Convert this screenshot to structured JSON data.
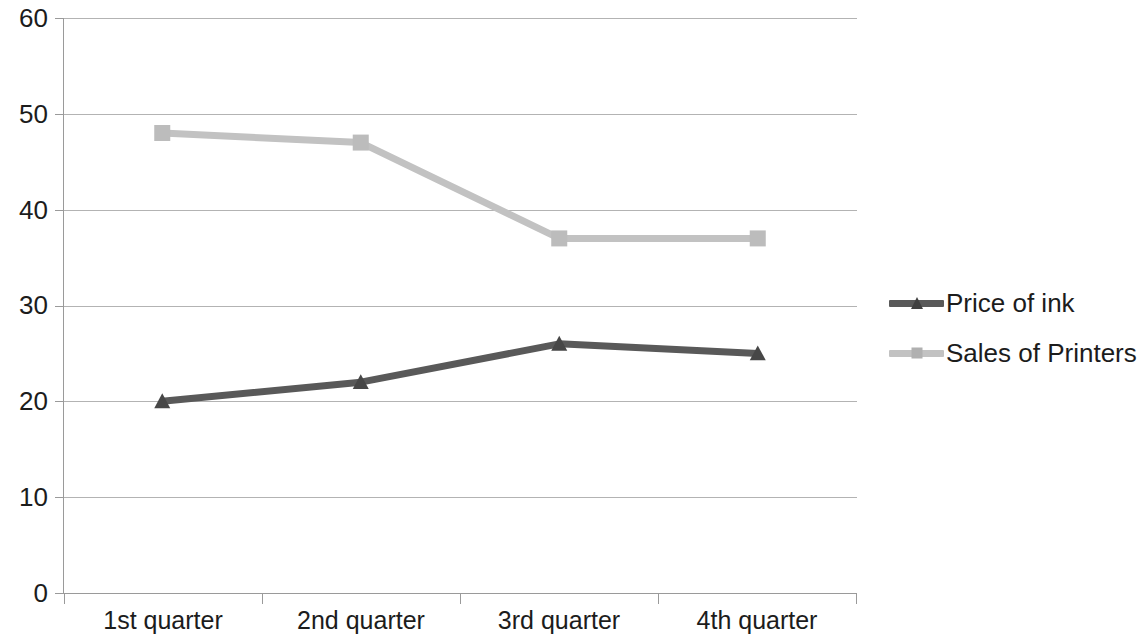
{
  "chart_data": {
    "type": "line",
    "title": "",
    "subtitle": "",
    "xlabel": "",
    "ylabel": "",
    "categories": [
      "1st quarter",
      "2nd quarter",
      "3rd quarter",
      "4th quarter"
    ],
    "series": [
      {
        "name": "Price of ink",
        "values": [
          20,
          22,
          26,
          25
        ],
        "color": "#595959",
        "marker": "triangle"
      },
      {
        "name": "Sales of Printers",
        "values": [
          48,
          47,
          37,
          37
        ],
        "color": "#c2c2c2",
        "marker": "square"
      }
    ],
    "ylim": [
      0,
      60
    ],
    "y_ticks": [
      0,
      10,
      20,
      30,
      40,
      50,
      60
    ],
    "y_tick_labels": [
      "0",
      "10",
      "20",
      "30",
      "40",
      "50",
      "60"
    ],
    "grid": true,
    "grid_axis": "y",
    "grid_color": "#b3b3b3",
    "legend_position": "right",
    "background": "#ffffff",
    "axis_color": "#9a9a9a",
    "text_color": "#1c1c1c"
  },
  "legend": {
    "entries": [
      {
        "label": "Price of ink"
      },
      {
        "label": "Sales of Printers"
      }
    ]
  },
  "axes": {
    "y_labels": [
      "60",
      "50",
      "40",
      "30",
      "20",
      "10",
      "0"
    ],
    "x_labels": [
      "1st quarter",
      "2nd quarter",
      "3rd quarter",
      "4th quarter"
    ]
  }
}
